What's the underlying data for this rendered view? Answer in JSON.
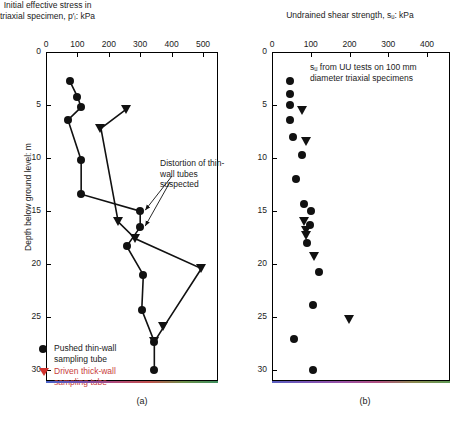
{
  "figure": {
    "panel_a_label": "(a)",
    "panel_b_label": "(b)",
    "y_axis_label": "Depth below ground level: m"
  },
  "panel_a": {
    "title_line1": "Initial effective stress in",
    "title_line2": "triaxial specimen, p′ᵢ: kPa",
    "annotation": "Distortion of thin-wall tubes suspected",
    "x_ticks": [
      0,
      100,
      200,
      300,
      400,
      500
    ],
    "y_ticks": [
      0,
      5,
      10,
      15,
      20,
      25,
      30
    ]
  },
  "panel_b": {
    "title": "Undrained shear strength, sᵤ: kPa",
    "annotation": "sᵤ from UU tests on 100 mm diameter triaxial specimens",
    "x_ticks": [
      0,
      100,
      200,
      300,
      400
    ],
    "y_ticks": [
      0,
      5,
      10,
      15,
      20,
      25,
      30
    ]
  },
  "legend": {
    "items": [
      {
        "marker": "circle",
        "color": "#111111",
        "label_line1": "Pushed thin-wall",
        "label_line2": "sampling tube"
      },
      {
        "marker": "triangle-down",
        "color": "#d0332f",
        "label_line1": "Driven thick-wall",
        "label_line2": "sampling tube"
      }
    ]
  },
  "chart_data": [
    {
      "type": "scatter",
      "id": "panel_a",
      "title": "Initial effective stress in triaxial specimen, p′ᵢ: kPa",
      "xlabel": "Initial effective stress in triaxial specimen, p′ᵢ: kPa",
      "ylabel": "Depth below ground level: m",
      "xlim": [
        0,
        530
      ],
      "ylim": [
        0,
        31
      ],
      "y_inverted": true,
      "grid": false,
      "legend_position": "bottom-left",
      "series": [
        {
          "name": "Pushed thin-wall sampling tube",
          "marker": "circle",
          "color": "#111111",
          "connected": true,
          "points": [
            {
              "x": 75,
              "depth": 2.7
            },
            {
              "x": 100,
              "depth": 4.2
            },
            {
              "x": 112,
              "depth": 5.2
            },
            {
              "x": 70,
              "depth": 6.4
            },
            {
              "x": 112,
              "depth": 10.2
            },
            {
              "x": 112,
              "depth": 13.4
            },
            {
              "x": 300,
              "depth": 15.0
            },
            {
              "x": 300,
              "depth": 16.5
            },
            {
              "x": 257,
              "depth": 18.3
            },
            {
              "x": 310,
              "depth": 21.0
            },
            {
              "x": 305,
              "depth": 24.3
            },
            {
              "x": 345,
              "depth": 27.3
            },
            {
              "x": 345,
              "depth": 30.0
            }
          ]
        },
        {
          "name": "Driven thick-wall sampling tube",
          "marker": "triangle-down",
          "color": "#111111",
          "connected": true,
          "points": [
            {
              "x": 255,
              "depth": 5.4
            },
            {
              "x": 175,
              "depth": 7.2
            },
            {
              "x": 230,
              "depth": 16.0
            },
            {
              "x": 285,
              "depth": 17.6
            },
            {
              "x": 495,
              "depth": 20.4
            },
            {
              "x": 375,
              "depth": 25.9
            },
            {
              "x": 345,
              "depth": 27.3
            }
          ]
        }
      ]
    },
    {
      "type": "scatter",
      "id": "panel_b",
      "title": "Undrained shear strength, sᵤ: kPa",
      "xlabel": "Undrained shear strength, sᵤ: kPa",
      "ylabel": "Depth below ground level: m",
      "xlim": [
        0,
        460
      ],
      "ylim": [
        0,
        31
      ],
      "y_inverted": true,
      "grid": false,
      "legend_position": "none",
      "series": [
        {
          "name": "Pushed thin-wall sampling tube",
          "marker": "circle",
          "color": "#111111",
          "connected": false,
          "points": [
            {
              "x": 47,
              "depth": 2.7
            },
            {
              "x": 47,
              "depth": 4.0
            },
            {
              "x": 47,
              "depth": 5.0
            },
            {
              "x": 47,
              "depth": 6.4
            },
            {
              "x": 55,
              "depth": 8.0
            },
            {
              "x": 78,
              "depth": 9.7
            },
            {
              "x": 63,
              "depth": 12.0
            },
            {
              "x": 82,
              "depth": 14.3
            },
            {
              "x": 100,
              "depth": 15.0
            },
            {
              "x": 98,
              "depth": 16.3
            },
            {
              "x": 90,
              "depth": 18.0
            },
            {
              "x": 122,
              "depth": 20.7
            },
            {
              "x": 105,
              "depth": 23.8
            },
            {
              "x": 58,
              "depth": 27.0
            },
            {
              "x": 105,
              "depth": 30.0
            }
          ]
        },
        {
          "name": "Driven thick-wall sampling tube",
          "marker": "triangle-down",
          "color": "#111111",
          "connected": false,
          "points": [
            {
              "x": 78,
              "depth": 5.5
            },
            {
              "x": 90,
              "depth": 8.4
            },
            {
              "x": 85,
              "depth": 16.0
            },
            {
              "x": 88,
              "depth": 17.3
            },
            {
              "x": 90,
              "depth": 16.8
            },
            {
              "x": 110,
              "depth": 19.3
            },
            {
              "x": 200,
              "depth": 25.2
            }
          ]
        }
      ]
    }
  ]
}
